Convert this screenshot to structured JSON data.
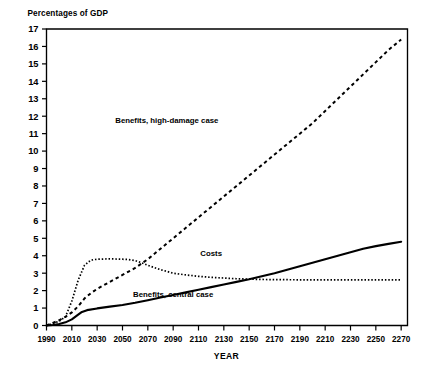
{
  "chart_data": {
    "type": "line",
    "title": "",
    "ylabel": "Percentages of GDP",
    "xlabel": "YEAR",
    "xlim": [
      1990,
      2275
    ],
    "ylim": [
      0,
      17
    ],
    "grid": false,
    "legend_position": "inline-annotations",
    "yticks": [
      0,
      1,
      2,
      3,
      4,
      5,
      6,
      7,
      8,
      9,
      10,
      11,
      12,
      13,
      14,
      15,
      16,
      17
    ],
    "ytick_labels": [
      "0",
      "1",
      "2",
      "3",
      "4",
      "5",
      "6",
      "7",
      "8",
      "9",
      "10",
      "11",
      "12",
      "13",
      "14",
      "15",
      "16",
      "17"
    ],
    "xticks": [
      1990,
      2010,
      2030,
      2050,
      2070,
      2090,
      2110,
      2130,
      2150,
      2170,
      2190,
      2210,
      2230,
      2250,
      2270
    ],
    "xtick_labels": [
      "1990",
      "2010",
      "2030",
      "2050",
      "2070",
      "2090",
      "2110",
      "2130",
      "2150",
      "2170",
      "2190",
      "2210",
      "2230",
      "2250",
      "2270"
    ],
    "series": [
      {
        "name": "Benefits, high-damage case",
        "style": "dashed",
        "annotation": "Benefits, high-damage case",
        "x": [
          1990,
          1995,
          2000,
          2005,
          2010,
          2015,
          2020,
          2025,
          2030,
          2040,
          2050,
          2060,
          2070,
          2080,
          2090,
          2100,
          2110,
          2120,
          2130,
          2140,
          2150,
          2160,
          2170,
          2180,
          2190,
          2200,
          2210,
          2220,
          2230,
          2240,
          2250,
          2260,
          2270
        ],
        "values": [
          0.0,
          0.15,
          0.3,
          0.5,
          0.75,
          1.1,
          1.55,
          1.85,
          2.1,
          2.5,
          2.9,
          3.3,
          3.8,
          4.4,
          5.0,
          5.6,
          6.2,
          6.8,
          7.4,
          8.0,
          8.6,
          9.2,
          9.8,
          10.4,
          11.0,
          11.6,
          12.3,
          13.0,
          13.7,
          14.4,
          15.1,
          15.8,
          16.4
        ]
      },
      {
        "name": "Costs",
        "style": "dotted",
        "annotation": "Costs",
        "x": [
          1990,
          1995,
          2000,
          2005,
          2010,
          2015,
          2020,
          2025,
          2030,
          2040,
          2050,
          2055,
          2060,
          2065,
          2070,
          2080,
          2090,
          2100,
          2110,
          2120,
          2130,
          2140,
          2150,
          2160,
          2170,
          2190,
          2210,
          2230,
          2250,
          2270
        ],
        "values": [
          0.0,
          0.1,
          0.25,
          0.5,
          1.4,
          2.6,
          3.45,
          3.75,
          3.8,
          3.82,
          3.8,
          3.78,
          3.72,
          3.6,
          3.45,
          3.2,
          3.0,
          2.9,
          2.82,
          2.76,
          2.72,
          2.68,
          2.66,
          2.64,
          2.63,
          2.62,
          2.62,
          2.62,
          2.62,
          2.62
        ]
      },
      {
        "name": "Benefits, central case",
        "style": "solid",
        "annotation": "Benefits, central case",
        "x": [
          1990,
          1995,
          2000,
          2005,
          2010,
          2015,
          2018,
          2022,
          2030,
          2040,
          2050,
          2060,
          2070,
          2080,
          2090,
          2100,
          2110,
          2120,
          2130,
          2140,
          2150,
          2160,
          2170,
          2180,
          2190,
          2200,
          2210,
          2220,
          2230,
          2240,
          2250,
          2260,
          2270
        ],
        "values": [
          0.0,
          0.03,
          0.08,
          0.18,
          0.35,
          0.62,
          0.78,
          0.88,
          0.98,
          1.08,
          1.18,
          1.3,
          1.45,
          1.6,
          1.75,
          1.9,
          2.05,
          2.2,
          2.35,
          2.5,
          2.65,
          2.82,
          3.0,
          3.2,
          3.4,
          3.6,
          3.8,
          4.0,
          4.2,
          4.4,
          4.55,
          4.68,
          4.8
        ]
      }
    ],
    "annotations": [
      {
        "text": "Benefits, high-damage case",
        "x": 2085,
        "y": 11.6
      },
      {
        "text": "Costs",
        "x": 2120,
        "y": 4.0
      },
      {
        "text": "Benefits, central case",
        "x": 2090,
        "y": 1.65
      }
    ]
  }
}
